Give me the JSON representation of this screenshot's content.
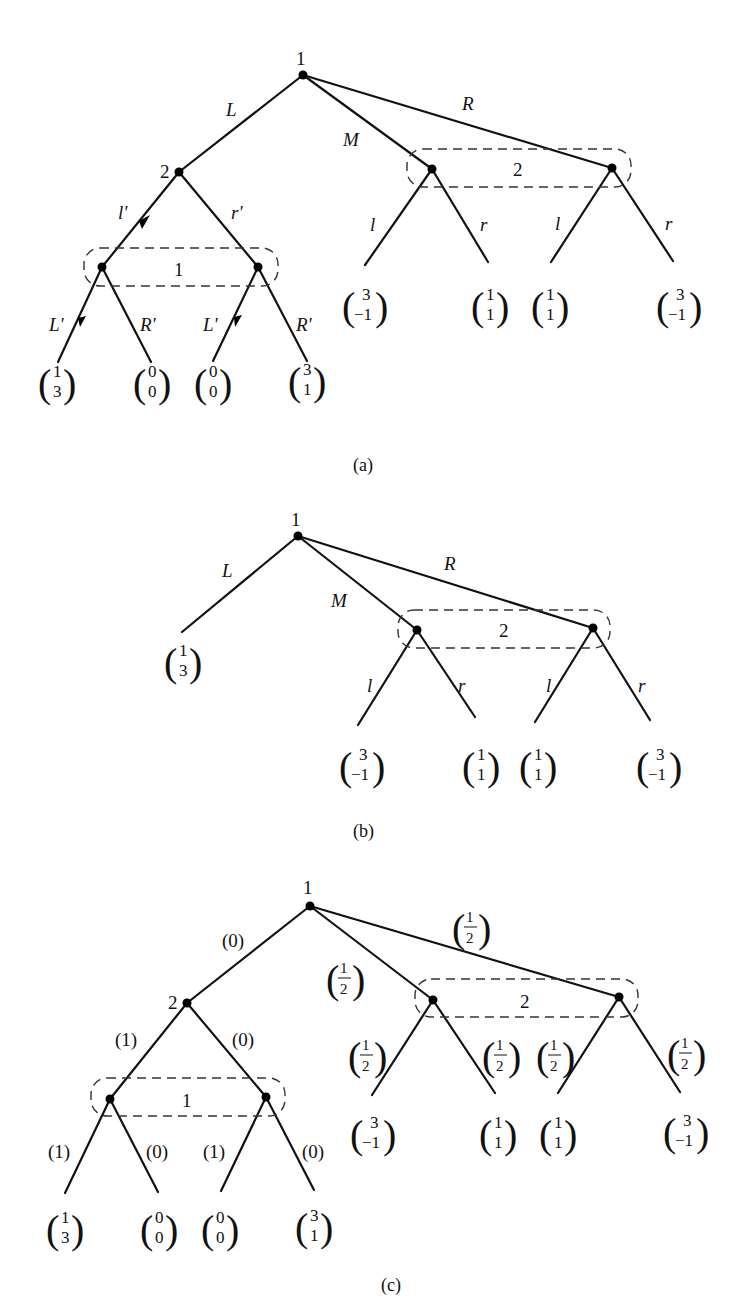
{
  "figures": [
    {
      "id": "a",
      "caption": "(a)",
      "root": {
        "player": "1",
        "actions": {
          "L": "L",
          "M": "M",
          "R": "R"
        }
      },
      "node2": {
        "player": "2",
        "actions": {
          "l": "l'",
          "r": "r'"
        }
      },
      "infoset_left": {
        "player": "1",
        "actions": {
          "L": "L'",
          "R": "R'"
        }
      },
      "infoset_right": {
        "player": "2",
        "actions": {
          "l": "l",
          "r": "r"
        }
      },
      "payoffs_left": [
        [
          "1",
          "3"
        ],
        [
          "0",
          "0"
        ],
        [
          "0",
          "0"
        ],
        [
          "3",
          "1"
        ]
      ],
      "payoffs_right": [
        [
          "3",
          "−1"
        ],
        [
          "1",
          "1"
        ],
        [
          "1",
          "1"
        ],
        [
          "3",
          "−1"
        ]
      ]
    },
    {
      "id": "b",
      "caption": "(b)",
      "root": {
        "player": "1",
        "actions": {
          "L": "L",
          "M": "M",
          "R": "R"
        }
      },
      "infoset_right": {
        "player": "2",
        "actions": {
          "l": "l",
          "r": "r"
        }
      },
      "payoff_L": [
        "1",
        "3"
      ],
      "payoffs_right": [
        [
          "3",
          "−1"
        ],
        [
          "1",
          "1"
        ],
        [
          "1",
          "1"
        ],
        [
          "3",
          "−1"
        ]
      ]
    },
    {
      "id": "c",
      "caption": "(c)",
      "root": {
        "player": "1",
        "probs": {
          "L": "(0)",
          "M_num": "1",
          "M_den": "2",
          "R_num": "1",
          "R_den": "2"
        }
      },
      "node2": {
        "player": "2",
        "probs": {
          "l": "(1)",
          "r": "(0)"
        }
      },
      "infoset_left": {
        "player": "1",
        "probs": {
          "L1": "(1)",
          "R1": "(0)",
          "L2": "(1)",
          "R2": "(0)"
        }
      },
      "infoset_right": {
        "player": "2",
        "prob_num": "1",
        "prob_den": "2"
      },
      "payoffs_left": [
        [
          "1",
          "3"
        ],
        [
          "0",
          "0"
        ],
        [
          "0",
          "0"
        ],
        [
          "3",
          "1"
        ]
      ],
      "payoffs_right": [
        [
          "3",
          "−1"
        ],
        [
          "1",
          "1"
        ],
        [
          "1",
          "1"
        ],
        [
          "3",
          "−1"
        ]
      ]
    }
  ]
}
